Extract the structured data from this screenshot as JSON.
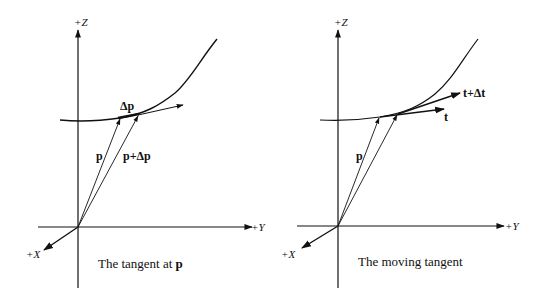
{
  "figure": {
    "left_panel": {
      "axes": {
        "z_label": "+Z",
        "y_label": "+Y",
        "x_label": "+X"
      },
      "vector_labels": {
        "p": "p",
        "p_plus_dp": "p+Δp",
        "dp": "Δp"
      },
      "caption_text": "The tangent at ",
      "caption_bold": "p"
    },
    "right_panel": {
      "axes": {
        "z_label": "+Z",
        "y_label": "+Y",
        "x_label": "+X"
      },
      "vector_labels": {
        "p": "p",
        "t": "t",
        "t_plus_dt": "t+Δt"
      },
      "caption_text": "The moving tangent"
    },
    "colors": {
      "stroke": "#111111",
      "background": "#ffffff"
    }
  }
}
